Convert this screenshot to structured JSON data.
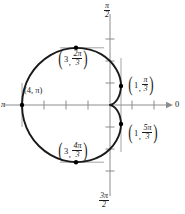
{
  "figure": {
    "type": "polar-graph",
    "curve_name": "cardioid",
    "background": "#ffffff",
    "curve_color": "#1a1a1a",
    "axis_color": "#8c8c8c",
    "point_color": "#000000"
  },
  "axis_labels": {
    "top": {
      "text": "π/2",
      "numerator": "π",
      "denominator": "2"
    },
    "bottom": {
      "text": "3π/2",
      "numerator": "3π",
      "denominator": "2"
    },
    "left": {
      "text": "π"
    },
    "right": {
      "text": "0"
    }
  },
  "point_labels": [
    {
      "id": "point-3-2pi-3",
      "r": "3",
      "angle_num": "2π",
      "angle_den": "3",
      "comma": ","
    },
    {
      "id": "point-4-pi",
      "r": "4",
      "angle": "π",
      "comma": ",",
      "text": "(4, π)"
    },
    {
      "id": "point-1-pi-3",
      "r": "1",
      "angle_num": "π",
      "angle_den": "3",
      "comma": ","
    },
    {
      "id": "point-1-5pi-3",
      "r": "1",
      "angle_num": "5π",
      "angle_den": "3",
      "comma": ","
    },
    {
      "id": "point-3-4pi-3",
      "r": "3",
      "angle_num": "4π",
      "angle_den": "3",
      "comma": ","
    }
  ],
  "chart_data": {
    "type": "line",
    "title": "",
    "xlabel": "",
    "ylabel": "",
    "coordinate_system": "polar",
    "equation": "r = 2 - 2cos(θ)",
    "theta_range_deg": [
      0,
      360
    ],
    "r_max": 4,
    "grid": false,
    "legend": null,
    "axis_tick_unit": 1,
    "polar_axis_labels": [
      "0",
      "π/2",
      "π",
      "3π/2"
    ],
    "marked_points": [
      {
        "label": "(3, 2π/3)",
        "r": 3,
        "theta_deg": 120
      },
      {
        "label": "(4, π)",
        "r": 4,
        "theta_deg": 180
      },
      {
        "label": "(3, 4π/3)",
        "r": 3,
        "theta_deg": 240
      },
      {
        "label": "(1, π/3)",
        "r": 1,
        "theta_deg": 60
      },
      {
        "label": "(1, 5π/3)",
        "r": 1,
        "theta_deg": 300
      }
    ],
    "series": [
      {
        "name": "r = 2 - 2cos(θ)",
        "theta_deg": [
          0,
          10,
          20,
          30,
          40,
          50,
          60,
          70,
          80,
          90,
          100,
          110,
          120,
          130,
          140,
          150,
          160,
          170,
          180,
          190,
          200,
          210,
          220,
          230,
          240,
          250,
          260,
          270,
          280,
          290,
          300,
          310,
          320,
          330,
          340,
          350,
          360
        ],
        "r": [
          0.0,
          0.03,
          0.12,
          0.27,
          0.47,
          0.71,
          1.0,
          1.32,
          1.65,
          2.0,
          2.35,
          2.68,
          3.0,
          3.29,
          3.53,
          3.73,
          3.88,
          3.97,
          4.0,
          3.97,
          3.88,
          3.73,
          3.53,
          3.29,
          3.0,
          2.68,
          2.35,
          2.0,
          1.65,
          1.32,
          1.0,
          0.71,
          0.47,
          0.27,
          0.12,
          0.03,
          0.0
        ]
      }
    ]
  }
}
